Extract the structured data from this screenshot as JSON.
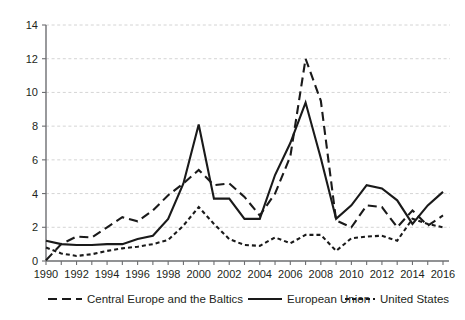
{
  "chart_data": {
    "type": "line",
    "title": "",
    "xlabel": "",
    "ylabel": "",
    "xlim": [
      1990,
      2016
    ],
    "ylim": [
      0,
      14
    ],
    "y_ticks": [
      0,
      2,
      4,
      6,
      8,
      10,
      12,
      14
    ],
    "x_ticks": [
      1990,
      1991,
      1992,
      1993,
      1994,
      1995,
      1996,
      1997,
      1998,
      1999,
      2000,
      2001,
      2002,
      2003,
      2004,
      2005,
      2006,
      2007,
      2008,
      2009,
      2010,
      2011,
      2012,
      2013,
      2014,
      2015,
      2016
    ],
    "x_tick_labels": [
      "1990",
      "",
      "1992",
      "",
      "1994",
      "",
      "1996",
      "",
      "1998",
      "",
      "2000",
      "",
      "2002",
      "",
      "2004",
      "",
      "2006",
      "",
      "2008",
      "",
      "2010",
      "",
      "2012",
      "",
      "2014",
      "",
      "2016"
    ],
    "y_tick_labels": [
      "0",
      "2",
      "4",
      "6",
      "8",
      "10",
      "12",
      "14"
    ],
    "grid": true,
    "grid_axis": "y",
    "legend_position": "bottom",
    "x": [
      1990,
      1991,
      1992,
      1993,
      1994,
      1995,
      1996,
      1997,
      1998,
      1999,
      2000,
      2001,
      2002,
      2003,
      2004,
      2005,
      2006,
      2007,
      2008,
      2009,
      2010,
      2011,
      2012,
      2013,
      2014,
      2015,
      2016
    ],
    "series": [
      {
        "name": "Central Europe and the Baltics",
        "style": "dashed",
        "color": "#1a1a1a",
        "values": [
          0.05,
          1.0,
          1.45,
          1.4,
          2.0,
          2.6,
          2.35,
          3.0,
          3.9,
          4.6,
          5.4,
          4.5,
          4.6,
          3.8,
          2.7,
          4.0,
          6.2,
          12.0,
          9.5,
          2.4,
          2.0,
          3.3,
          3.2,
          2.0,
          3.0,
          2.1,
          2.7
        ]
      },
      {
        "name": "European Union",
        "style": "solid",
        "color": "#1a1a1a",
        "values": [
          1.2,
          1.0,
          0.95,
          0.95,
          1.0,
          1.0,
          1.3,
          1.5,
          2.5,
          4.6,
          8.1,
          3.7,
          3.7,
          2.5,
          2.5,
          5.1,
          7.0,
          9.4,
          6.1,
          2.5,
          3.3,
          4.5,
          4.3,
          3.6,
          2.2,
          3.3,
          4.1
        ]
      },
      {
        "name": "United States",
        "style": "dotted",
        "color": "#1a1a1a",
        "values": [
          0.8,
          0.45,
          0.3,
          0.4,
          0.6,
          0.75,
          0.85,
          1.0,
          1.25,
          2.1,
          3.2,
          2.2,
          1.3,
          0.95,
          0.9,
          1.4,
          1.05,
          1.55,
          1.55,
          0.6,
          1.35,
          1.45,
          1.5,
          1.2,
          2.5,
          2.2,
          2.0
        ]
      }
    ]
  },
  "legend": {
    "items": [
      {
        "label": "Central Europe and the Baltics",
        "style": "dashed"
      },
      {
        "label": "European Union",
        "style": "solid"
      },
      {
        "label": "United States",
        "style": "dotted"
      }
    ]
  },
  "colors": {
    "line": "#1a1a1a",
    "grid": "#c9c9c9",
    "axis": "#6d6e71",
    "text": "#231f20",
    "background": "#ffffff"
  }
}
